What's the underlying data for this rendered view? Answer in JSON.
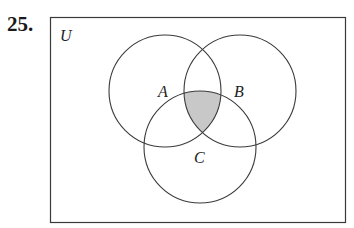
{
  "problem": {
    "number": "25."
  },
  "diagram": {
    "universe_label": "U",
    "sets": [
      {
        "name": "A",
        "cx": 165,
        "cy": 91,
        "r": 56,
        "label_x": 158,
        "label_y": 97
      },
      {
        "name": "B",
        "cx": 240,
        "cy": 91,
        "r": 56,
        "label_x": 235,
        "label_y": 97
      },
      {
        "name": "C",
        "cx": 200,
        "cy": 147,
        "r": 56,
        "label_x": 194,
        "label_y": 162
      }
    ],
    "shaded_region": "A ∩ B ∩ C",
    "colors": {
      "line": "#3a3a3a",
      "shade": "#c8c8c8",
      "background": "#ffffff"
    }
  }
}
